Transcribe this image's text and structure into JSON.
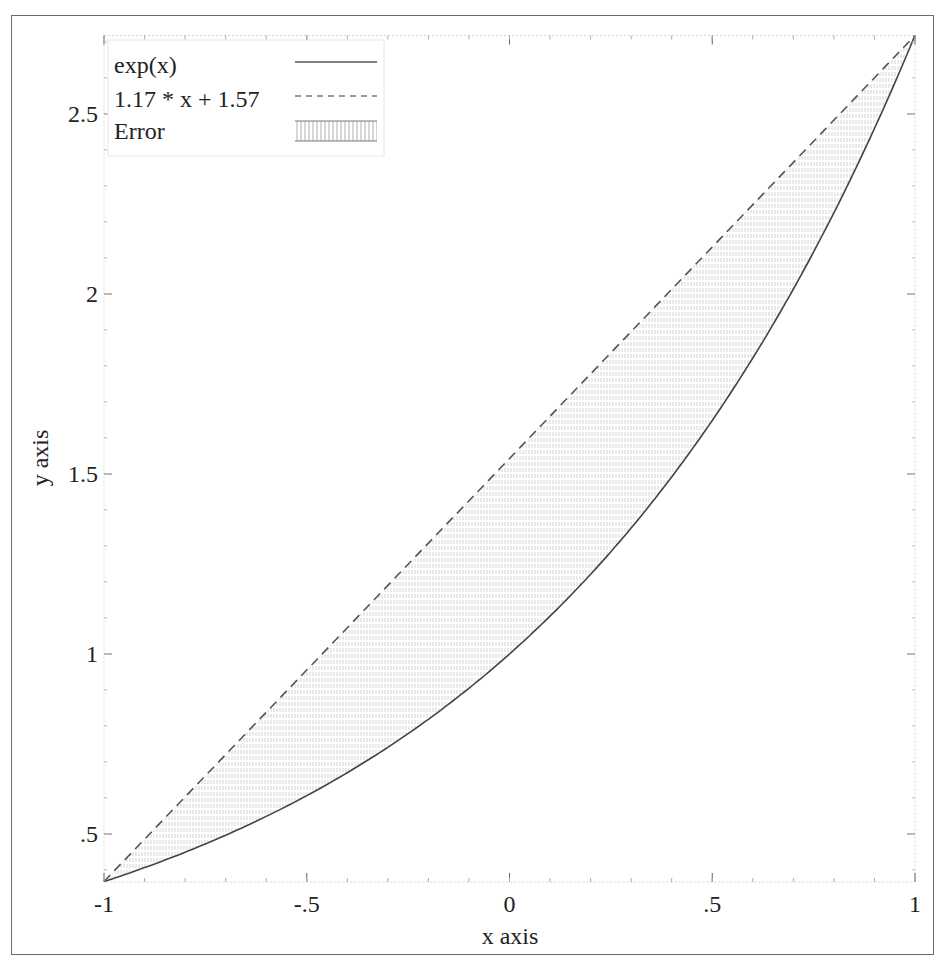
{
  "chart_data": {
    "type": "line",
    "title": "",
    "xlabel": "x axis",
    "ylabel": "y axis",
    "xlim": [
      -1,
      1
    ],
    "ylim": [
      0.3679,
      2.7183
    ],
    "grid": false,
    "legend_position": "upper left",
    "x_ticks": [
      {
        "value": -1,
        "label": "-1"
      },
      {
        "value": -0.5,
        "label": "-.5"
      },
      {
        "value": 0,
        "label": "0"
      },
      {
        "value": 0.5,
        "label": ".5"
      },
      {
        "value": 1,
        "label": "1"
      }
    ],
    "y_ticks": [
      {
        "value": 0.5,
        "label": ".5"
      },
      {
        "value": 1,
        "label": "1"
      },
      {
        "value": 1.5,
        "label": "1.5"
      },
      {
        "value": 2,
        "label": "2"
      },
      {
        "value": 2.5,
        "label": "2.5"
      }
    ],
    "series": [
      {
        "name": "exp(x)",
        "style": "solid",
        "function": "exp(x)",
        "x": [
          -1,
          -0.75,
          -0.5,
          -0.25,
          0,
          0.25,
          0.5,
          0.75,
          1
        ],
        "values": [
          0.368,
          0.472,
          0.607,
          0.779,
          1.0,
          1.284,
          1.649,
          2.117,
          2.718
        ]
      },
      {
        "name": "1.17 * x + 1.57",
        "style": "dashed",
        "function": "1.17*x+1.57",
        "x": [
          -1,
          1
        ],
        "values": [
          0.368,
          2.718
        ]
      },
      {
        "name": "Error",
        "style": "hatched-fill",
        "description": "Region between exp(x) and linear approximation"
      }
    ]
  },
  "legend": {
    "items": [
      {
        "label": "exp(x)"
      },
      {
        "label": "1.17 * x + 1.57"
      },
      {
        "label": "Error"
      }
    ]
  },
  "axes": {
    "xlabel": "x axis",
    "ylabel": "y axis"
  }
}
